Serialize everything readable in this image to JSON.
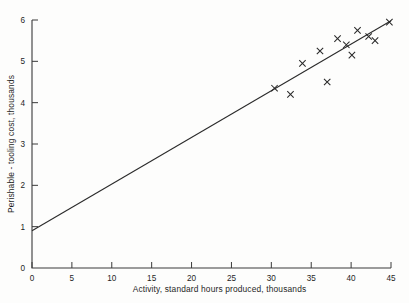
{
  "chart_data": {
    "type": "scatter",
    "title": "",
    "xlabel": "Activity, standard hours produced, thousands",
    "ylabel": "Perishable - tooling cost, thousands",
    "xlim": [
      0,
      45
    ],
    "ylim": [
      0,
      6
    ],
    "xticks": [
      0,
      5,
      10,
      15,
      20,
      25,
      30,
      35,
      40,
      45
    ],
    "yticks": [
      0,
      1,
      2,
      3,
      4,
      5,
      6
    ],
    "xtick_labels": [
      "0",
      "5",
      "10",
      "15",
      "20",
      "25",
      "30",
      "35",
      "40",
      "45"
    ],
    "ytick_labels": [
      "0",
      "1",
      "2",
      "3",
      "4",
      "5",
      "6"
    ],
    "grid": false,
    "legend": false,
    "marker_symbol": "x",
    "points": [
      {
        "x": 30.4,
        "y": 4.35
      },
      {
        "x": 32.4,
        "y": 4.2
      },
      {
        "x": 33.9,
        "y": 4.95
      },
      {
        "x": 36.1,
        "y": 5.25
      },
      {
        "x": 37.0,
        "y": 4.5
      },
      {
        "x": 38.3,
        "y": 5.55
      },
      {
        "x": 39.4,
        "y": 5.4
      },
      {
        "x": 40.1,
        "y": 5.15
      },
      {
        "x": 40.8,
        "y": 5.75
      },
      {
        "x": 42.2,
        "y": 5.6
      },
      {
        "x": 43.0,
        "y": 5.5
      },
      {
        "x": 44.8,
        "y": 5.95
      }
    ],
    "fit_line": {
      "name": "regression line",
      "x_start": 0,
      "y_start": 0.9,
      "x_end": 45,
      "y_end": 5.98,
      "intercept": 0.9,
      "slope": 0.1129
    }
  }
}
